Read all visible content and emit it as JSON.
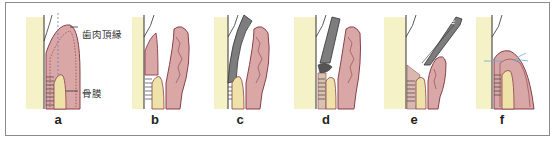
{
  "figure": {
    "panels": [
      {
        "id": "a",
        "label": "a"
      },
      {
        "id": "b",
        "label": "b"
      },
      {
        "id": "c",
        "label": "c"
      },
      {
        "id": "d",
        "label": "d"
      },
      {
        "id": "e",
        "label": "e"
      },
      {
        "id": "f",
        "label": "f"
      }
    ],
    "annotations": {
      "gingival_margin": "歯肉頂縁",
      "periosteum": "骨膜",
      "instrument_letter": "e"
    },
    "colors": {
      "tooth": "#f6f2c8",
      "gingiva": "#d9a7a6",
      "gingiva_outline": "#8a3f4a",
      "bone": "#efe2a8",
      "instrument": "#7d7d7d",
      "frame": "#8a8a8a",
      "suture": "#6aa7d8",
      "dashed_line": "#6b7fd0"
    }
  }
}
